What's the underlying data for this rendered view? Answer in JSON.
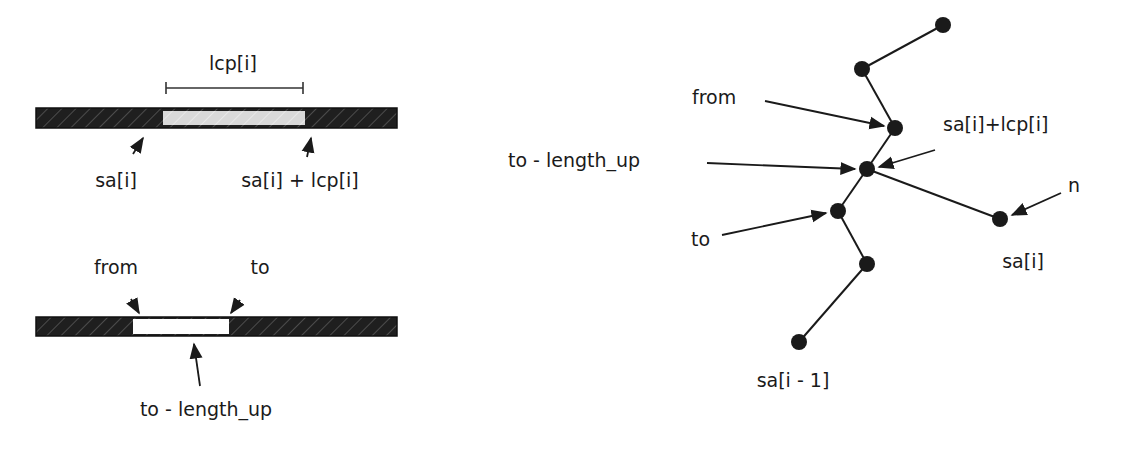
{
  "left_panel": {
    "top_bar": {
      "bracket_label": "lcp[i]",
      "start_label": "sa[i]",
      "end_label": "sa[i] + lcp[i]"
    },
    "bottom_bar": {
      "from_label": "from",
      "to_label": "to",
      "below_label": "to - length_up"
    }
  },
  "right_panel": {
    "labels": {
      "from": "from",
      "sa_plus_lcp": "sa[i]+lcp[i]",
      "to_minus_length_up": "to - length_up",
      "n": "n",
      "to": "to",
      "sa_i": "sa[i]",
      "sa_i_minus_1": "sa[i - 1]"
    }
  },
  "colors": {
    "ink": "#1a1a1a",
    "bar_dark": "#1f1f1f",
    "highlight_light": "#d9d9d9",
    "highlight_white": "#ffffff"
  }
}
